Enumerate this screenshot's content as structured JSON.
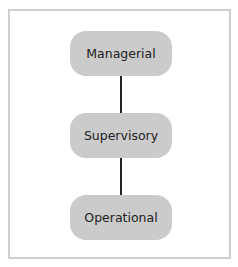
{
  "diagram": {
    "type": "hierarchy",
    "nodes": [
      {
        "id": "managerial",
        "label": "Managerial"
      },
      {
        "id": "supervisory",
        "label": "Supervisory"
      },
      {
        "id": "operational",
        "label": "Operational"
      }
    ],
    "edges": [
      {
        "from": "managerial",
        "to": "supervisory"
      },
      {
        "from": "supervisory",
        "to": "operational"
      }
    ],
    "colors": {
      "node_fill": "#cbcbcb",
      "frame_border": "#cfcfcf",
      "connector": "#222222",
      "text": "#222222"
    }
  }
}
